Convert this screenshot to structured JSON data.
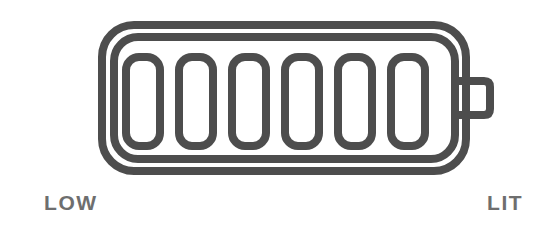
{
  "scene": {
    "width": 534,
    "height": 233,
    "background_color": "#ffffff",
    "description": "battery-charge-indicator-illustration"
  },
  "colors": {
    "stroke": "#4d4d4d",
    "label_text": "#6e6e6e",
    "background": "#ffffff",
    "segment_fill": "none"
  },
  "battery": {
    "icon_name": "battery-icon",
    "outer_shell": {
      "name": "battery-outer-outline",
      "x": 98,
      "y": 21,
      "width": 372,
      "height": 154,
      "corner_radius": 34,
      "stroke_width": 8
    },
    "inner_shell": {
      "name": "battery-inner-outline",
      "x": 110,
      "y": 33,
      "width": 349,
      "height": 130,
      "corner_radius": 26,
      "stroke_width": 8
    },
    "terminal": {
      "name": "battery-terminal-cap",
      "x": 459,
      "y": 77,
      "width": 33,
      "height": 42,
      "corner_radius": 9,
      "stroke_width": 8
    },
    "segments": {
      "count": 6,
      "filled_count": 0,
      "first_x": 122,
      "y": 53,
      "width": 42,
      "height": 97,
      "pitch": 53,
      "corner_radius": 14,
      "stroke_width": 8,
      "items": [
        {
          "name": "battery-segment-1",
          "filled": false
        },
        {
          "name": "battery-segment-2",
          "filled": false
        },
        {
          "name": "battery-segment-3",
          "filled": false
        },
        {
          "name": "battery-segment-4",
          "filled": false
        },
        {
          "name": "battery-segment-5",
          "filled": false
        },
        {
          "name": "battery-segment-6",
          "filled": false
        }
      ]
    }
  },
  "labels": {
    "low": "LOW",
    "lit": "LIT"
  }
}
